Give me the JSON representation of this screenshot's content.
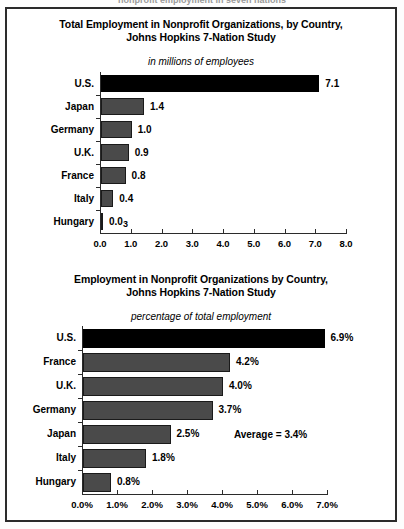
{
  "scan_header_fragment": "nonprofit employment in seven nations",
  "frame": {
    "border_color": "#2b2b2b",
    "background": "#ffffff"
  },
  "colors": {
    "bar_gray": "#4a4a4a",
    "bar_highlight": "#000000",
    "axis": "#2b2b2b",
    "text": "#000000"
  },
  "chart_data": [
    {
      "id": "total-employment",
      "type": "bar",
      "orientation": "horizontal",
      "title": "Total Employment in Nonprofit Organizations, by Country,\nJohns Hopkins 7-Nation Study",
      "title_line1": "Total Employment in Nonprofit Organizations, by Country,",
      "title_line2": "Johns Hopkins 7-Nation Study",
      "subtitle": "in millions of employees",
      "xlabel": "",
      "ylabel": "",
      "categories": [
        "U.S.",
        "Japan",
        "Germany",
        "U.K.",
        "France",
        "Italy",
        "Hungary"
      ],
      "values": [
        7.1,
        1.4,
        1.0,
        0.9,
        0.8,
        0.4,
        0.03
      ],
      "value_labels": [
        "7.1",
        "1.4",
        "1.0",
        "0.9",
        "0.8",
        "0.4",
        "0.03"
      ],
      "highlight_index": 0,
      "xlim": [
        0.0,
        8.0
      ],
      "xticks": [
        0.0,
        1.0,
        2.0,
        3.0,
        4.0,
        5.0,
        6.0,
        7.0,
        8.0
      ],
      "xtick_labels": [
        "0.0",
        "1.0",
        "2.0",
        "3.0",
        "4.0",
        "5.0",
        "6.0",
        "7.0",
        "8.0"
      ],
      "grid": false,
      "legend": null
    },
    {
      "id": "percentage-employment",
      "type": "bar",
      "orientation": "horizontal",
      "title": "Employment in Nonprofit Organizations by Country,\nJohns Hopkins 7-Nation Study",
      "title_line1": "Employment in Nonprofit Organizations by Country,",
      "title_line2": "Johns Hopkins 7-Nation Study",
      "subtitle": "percentage of total employment",
      "xlabel": "",
      "ylabel": "",
      "categories": [
        "U.S.",
        "France",
        "U.K.",
        "Germany",
        "Japan",
        "Italy",
        "Hungary"
      ],
      "values": [
        6.9,
        4.2,
        4.0,
        3.7,
        2.5,
        1.8,
        0.8
      ],
      "value_labels": [
        "6.9%",
        "4.2%",
        "4.0%",
        "3.7%",
        "2.5%",
        "1.8%",
        "0.8%"
      ],
      "highlight_index": 0,
      "xlim": [
        0.0,
        7.0
      ],
      "xticks": [
        0.0,
        1.0,
        2.0,
        3.0,
        4.0,
        5.0,
        6.0,
        7.0
      ],
      "xtick_labels": [
        "0.0%",
        "1.0%",
        "2.0%",
        "3.0%",
        "4.0%",
        "5.0%",
        "6.0%",
        "7.0%"
      ],
      "grid": false,
      "legend": null,
      "annotations": [
        {
          "text": "Average = 3.4%",
          "x_pct": 3.4,
          "row_index": 4
        }
      ]
    }
  ]
}
